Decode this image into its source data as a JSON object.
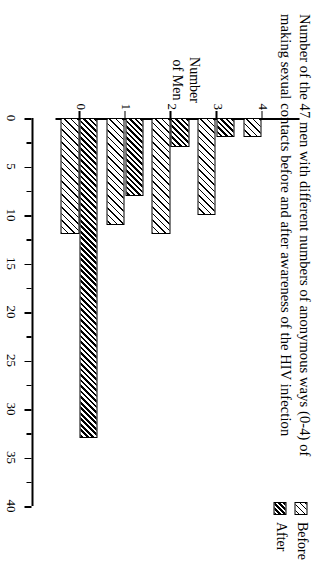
{
  "figure": {
    "title": "Number of the 47 men with different numbers of anonymous ways (0-4) of making sexual contacts before and after awareness of the HIV infection",
    "value_axis_title_line1": "Number",
    "value_axis_title_line2": "of Men",
    "legend": [
      {
        "label": "Before",
        "swatch": "light-hatch-swatch"
      },
      {
        "label": "After",
        "swatch": "dark-hatch-swatch"
      }
    ]
  },
  "chart_data": {
    "type": "bar",
    "orientation": "horizontal",
    "title": "Number of the 47 men with different numbers of anonymous ways (0-4) of making sexual contacts before and after awareness of the HIV infection",
    "xlabel": "Number of Men",
    "ylabel": "",
    "categories": [
      "0",
      "1",
      "2",
      "3",
      "4"
    ],
    "series": [
      {
        "name": "Before",
        "values": [
          12,
          11,
          12,
          10,
          2
        ]
      },
      {
        "name": "After",
        "values": [
          33,
          8,
          3,
          2,
          0
        ]
      }
    ],
    "xlim": [
      0,
      40
    ],
    "xticks": [
      0,
      5,
      10,
      15,
      20,
      25,
      30,
      35,
      40
    ],
    "xtick_labels": [
      "0",
      "5",
      "10",
      "15",
      "20",
      "25",
      "30",
      "35",
      "40"
    ],
    "ytick_labels": [
      "0",
      "1",
      "2",
      "3",
      "4"
    ],
    "grid": false,
    "legend_position": "top-right"
  }
}
